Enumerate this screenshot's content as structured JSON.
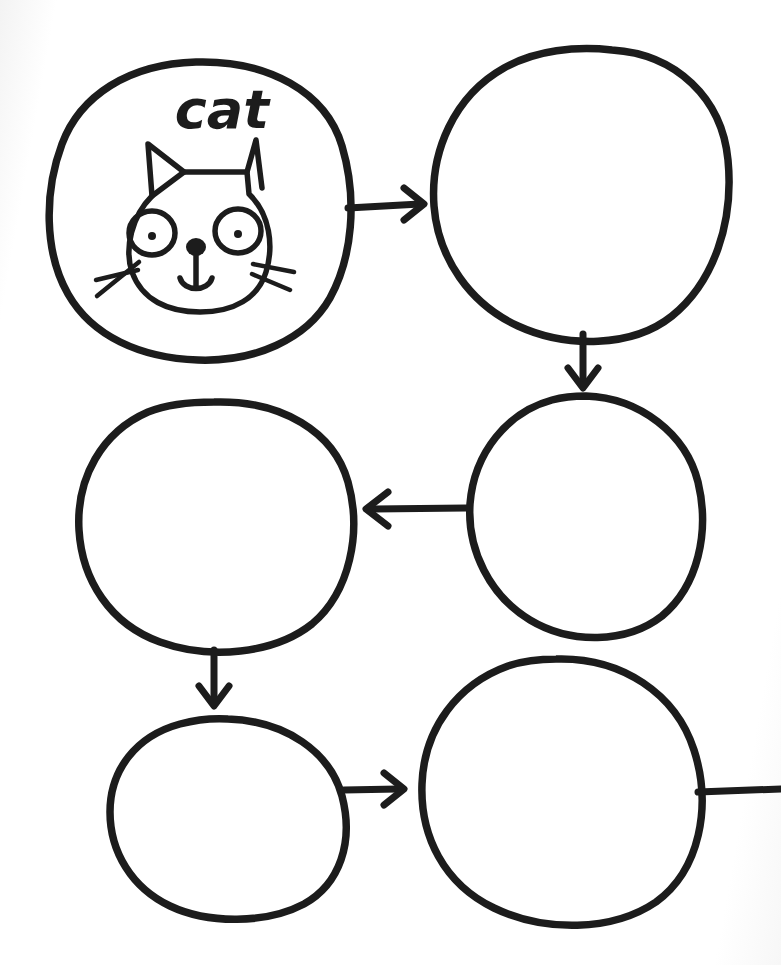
{
  "page": {
    "background_color": "#ffffff",
    "ink_color": "#1c1c1c",
    "width": 781,
    "height": 965
  },
  "nodes": [
    {
      "id": "node-1",
      "label": "cat",
      "label_x": 222,
      "label_y": 128,
      "filled": true,
      "illustration": "cat-face-drawing",
      "center_x": 195,
      "center_y": 210,
      "radius_x": 148,
      "radius_y": 150
    },
    {
      "id": "node-2",
      "label": "",
      "filled": false,
      "illustration": "",
      "center_x": 580,
      "center_y": 192,
      "radius_x": 148,
      "radius_y": 144
    },
    {
      "id": "node-3",
      "label": "",
      "filled": false,
      "illustration": "",
      "center_x": 584,
      "center_y": 515,
      "radius_x": 117,
      "radius_y": 120
    },
    {
      "id": "node-4",
      "label": "",
      "filled": false,
      "illustration": "",
      "center_x": 215,
      "center_y": 528,
      "radius_x": 137,
      "radius_y": 128
    },
    {
      "id": "node-5",
      "label": "",
      "filled": false,
      "illustration": "",
      "center_x": 226,
      "center_y": 817,
      "radius_x": 119,
      "radius_y": 99
    },
    {
      "id": "node-6",
      "label": "",
      "filled": false,
      "illustration": "",
      "center_x": 562,
      "center_y": 790,
      "radius_x": 140,
      "radius_y": 135
    }
  ],
  "arrows": [
    {
      "id": "arrow-1",
      "from": "node-1",
      "to": "node-2",
      "direction": "right"
    },
    {
      "id": "arrow-2",
      "from": "node-2",
      "to": "node-3",
      "direction": "down"
    },
    {
      "id": "arrow-3",
      "from": "node-3",
      "to": "node-4",
      "direction": "left"
    },
    {
      "id": "arrow-4",
      "from": "node-4",
      "to": "node-5",
      "direction": "down"
    },
    {
      "id": "arrow-5",
      "from": "node-5",
      "to": "node-6",
      "direction": "right"
    },
    {
      "id": "arrow-6",
      "from": "node-6",
      "to": "off-page",
      "direction": "right",
      "headless": true
    }
  ],
  "cat_face": {
    "name": "cat-face-drawing",
    "parts": [
      "left-ear",
      "right-ear",
      "head-outline",
      "left-eye",
      "left-pupil",
      "right-eye",
      "right-pupil",
      "nose",
      "muzzle-line",
      "mouth",
      "left-whisker-upper",
      "left-whisker-lower",
      "right-whisker-upper",
      "right-whisker-lower"
    ]
  }
}
